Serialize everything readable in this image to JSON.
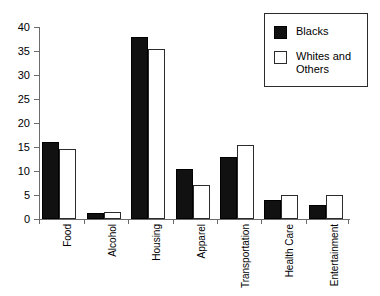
{
  "chart_data": {
    "type": "bar",
    "title": "",
    "xlabel": "",
    "ylabel": "",
    "ylim": [
      0,
      40
    ],
    "yticks": [
      0,
      5,
      10,
      15,
      20,
      25,
      30,
      35,
      40
    ],
    "grid": false,
    "legend_position": "top-right",
    "categories": [
      "Food",
      "Alcohol",
      "Housing",
      "Apparel",
      "Transportation",
      "Health Care",
      "Entertainment"
    ],
    "series": [
      {
        "name": "Blacks",
        "color": "#111111",
        "swatch": "filled-black-square",
        "values": [
          16,
          1.3,
          38,
          10.5,
          13,
          4,
          3
        ]
      },
      {
        "name": "Whites and Others",
        "color": "#ffffff",
        "swatch": "outlined-white-square",
        "values": [
          14.5,
          1.5,
          35.5,
          7,
          15.5,
          5,
          5
        ]
      }
    ]
  },
  "legend": {
    "items": [
      {
        "label": "Blacks"
      },
      {
        "label": "Whites and Others"
      }
    ]
  },
  "axis": {
    "y_tick_labels": [
      "0",
      "5",
      "10",
      "15",
      "20",
      "25",
      "30",
      "35",
      "40"
    ]
  }
}
